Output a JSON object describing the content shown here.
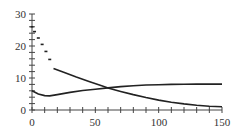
{
  "chart_data": {
    "type": "line",
    "title": "",
    "xlabel": "",
    "ylabel": "",
    "xlim": [
      0,
      150
    ],
    "ylim": [
      0,
      30
    ],
    "grid": false,
    "legend": null,
    "x_ticks": [
      0,
      50,
      100,
      150
    ],
    "y_ticks": [
      0,
      10,
      20,
      30
    ],
    "x_minor_step": 10,
    "y_minor_step": 2,
    "series": [
      {
        "name": "decaying curve",
        "style": "dashed for x<17, solid afterwards",
        "color": "#222222",
        "points": [
          [
            0,
            26
          ],
          [
            2,
            24.5
          ],
          [
            5,
            22.5
          ],
          [
            8,
            20.5
          ],
          [
            11,
            18.3
          ],
          [
            14,
            15.8
          ],
          [
            17,
            13
          ],
          [
            25,
            11.8
          ],
          [
            35,
            10.3
          ],
          [
            45,
            8.9
          ],
          [
            55,
            7.6
          ],
          [
            60,
            6.9
          ],
          [
            70,
            5.8
          ],
          [
            80,
            4.8
          ],
          [
            90,
            3.9
          ],
          [
            100,
            3.1
          ],
          [
            110,
            2.4
          ],
          [
            120,
            1.9
          ],
          [
            130,
            1.5
          ],
          [
            140,
            1.2
          ],
          [
            150,
            1.0
          ]
        ]
      },
      {
        "name": "rising curve",
        "style": "solid",
        "color": "#222222",
        "points": [
          [
            0,
            6
          ],
          [
            5,
            5
          ],
          [
            10,
            4.5
          ],
          [
            14,
            4.4
          ],
          [
            20,
            4.8
          ],
          [
            30,
            5.5
          ],
          [
            40,
            6.1
          ],
          [
            50,
            6.5
          ],
          [
            60,
            6.9
          ],
          [
            70,
            7.3
          ],
          [
            80,
            7.6
          ],
          [
            90,
            7.8
          ],
          [
            100,
            7.9
          ],
          [
            110,
            8.0
          ],
          [
            120,
            8.05
          ],
          [
            130,
            8.1
          ],
          [
            140,
            8.1
          ],
          [
            150,
            8.1
          ]
        ]
      }
    ]
  },
  "axis": {
    "x_labels": [
      "0",
      "50",
      "100",
      "150"
    ],
    "y_labels": [
      "0",
      "10",
      "20",
      "30"
    ]
  }
}
